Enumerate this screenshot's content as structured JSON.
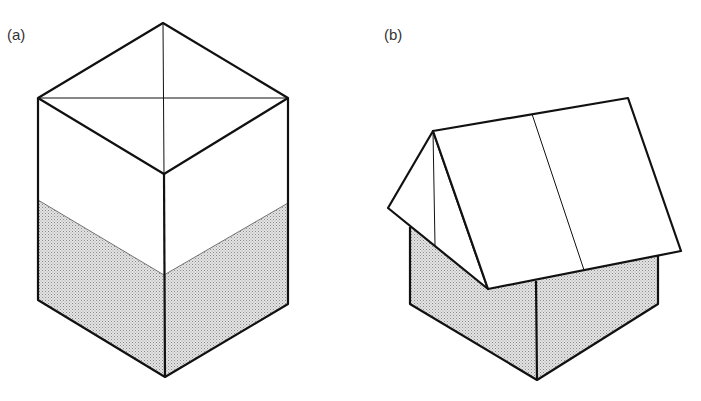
{
  "figure": {
    "panels": [
      {
        "label": "(a)",
        "description": "Isometric cuboid with diagonals on top face and shaded lower half"
      },
      {
        "label": "(b)",
        "description": "Isometric house with pitched roof and shaded walls"
      }
    ]
  },
  "colors": {
    "stroke": "#111111",
    "shade": "#c8c8c8",
    "background": "#ffffff"
  }
}
